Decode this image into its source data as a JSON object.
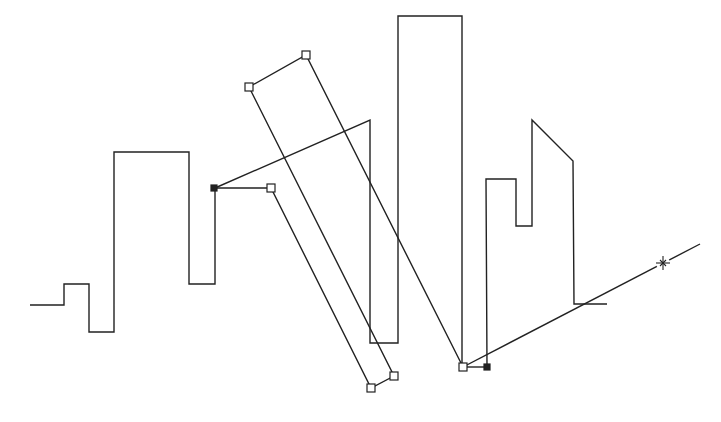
{
  "canvas": {
    "width": 721,
    "height": 422,
    "background": "#ffffff",
    "stroke_color": "#222222",
    "stroke_width": 1.4
  },
  "skyline_path": {
    "points": [
      [
        30,
        305
      ],
      [
        64,
        305
      ],
      [
        64,
        284
      ],
      [
        89,
        284
      ],
      [
        89,
        332
      ],
      [
        114,
        332
      ],
      [
        114,
        152
      ],
      [
        189,
        152
      ],
      [
        189,
        284
      ],
      [
        215,
        284
      ],
      [
        215,
        188
      ]
    ]
  },
  "connector_from_anchor": {
    "points": [
      [
        215,
        188
      ],
      [
        370,
        120
      ],
      [
        370,
        343
      ],
      [
        398,
        343
      ],
      [
        398,
        16
      ],
      [
        462,
        16
      ],
      [
        462,
        367
      ]
    ]
  },
  "right_buildings_path": {
    "points": [
      [
        487,
        367
      ],
      [
        486,
        179
      ],
      [
        516,
        179
      ],
      [
        516,
        226
      ],
      [
        532,
        226
      ],
      [
        532,
        120
      ],
      [
        573,
        161
      ],
      [
        574,
        304
      ],
      [
        607,
        304
      ]
    ]
  },
  "base_segment": {
    "points": [
      [
        463,
        367
      ],
      [
        487,
        367
      ]
    ]
  },
  "guide_line": {
    "points": [
      [
        463,
        367
      ],
      [
        700,
        244
      ]
    ]
  },
  "selected_outline_upper": {
    "points": [
      [
        249,
        87
      ],
      [
        306,
        55
      ],
      [
        463,
        367
      ]
    ]
  },
  "selected_outline_lower": {
    "points": [
      [
        249,
        87
      ],
      [
        394,
        376
      ],
      [
        371,
        388
      ],
      [
        271,
        188
      ],
      [
        215,
        188
      ]
    ]
  },
  "grips": [
    {
      "name": "grip-top-left",
      "x": 249,
      "y": 87,
      "filled": false
    },
    {
      "name": "grip-top-right",
      "x": 306,
      "y": 55,
      "filled": false
    },
    {
      "name": "grip-mid-left",
      "x": 271,
      "y": 188,
      "filled": false
    },
    {
      "name": "grip-bottom-right",
      "x": 394,
      "y": 376,
      "filled": false
    },
    {
      "name": "grip-bottom-left",
      "x": 371,
      "y": 388,
      "filled": false
    },
    {
      "name": "grip-base",
      "x": 463,
      "y": 367,
      "filled": false
    },
    {
      "name": "anchor-left",
      "x": 214,
      "y": 188,
      "filled": true
    },
    {
      "name": "anchor-right",
      "x": 487,
      "y": 367,
      "filled": true
    }
  ],
  "cursor": {
    "icon": "crosshair-star-icon",
    "x": 663,
    "y": 263
  }
}
